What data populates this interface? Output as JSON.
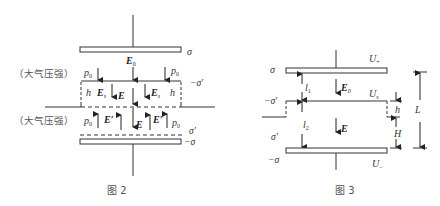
{
  "figure2": {
    "caption": "图 2",
    "top_plate_charge": "σ",
    "field_E0": "E",
    "field_E0_sub": "0",
    "atmos_label_upper": "（大气压强）",
    "atmos_label_lower": "（大气压强）",
    "p0_sym": "p",
    "p0_sub": "0",
    "neg_sigma_prime": "−σ′",
    "h_label": "h",
    "Es_sym": "E",
    "Es_sub": "s",
    "E_label": "E",
    "E_prime_label": "E′",
    "sigma_prime": "σ′",
    "neg_sigma": "−σ"
  },
  "figure3": {
    "caption": "图 3",
    "top_plate_charge": "σ",
    "U_top": "U",
    "U_top_sub": "+",
    "l1": "l",
    "l1_sub": "1",
    "E0": "E",
    "E0_sub": "0",
    "U_s": "U",
    "U_s_sub": "s",
    "neg_sigma_prime": "−σ′",
    "h_label": "h",
    "L_label": "L",
    "l2": "l",
    "l2_sub": "2",
    "E_label": "E",
    "H_label": "H",
    "sigma_prime": "σ′",
    "neg_sigma": "−σ",
    "U_bottom": "U",
    "U_bottom_sub": "−"
  }
}
